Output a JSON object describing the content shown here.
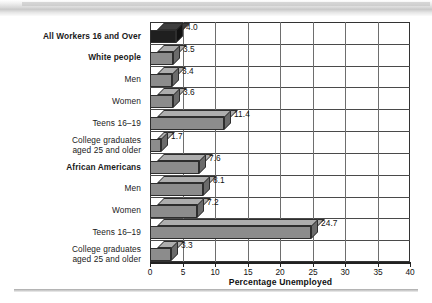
{
  "chart_data": {
    "type": "bar",
    "orientation": "horizontal",
    "title": "",
    "xlabel": "Percentage Unemployed",
    "ylabel": "",
    "xlim": [
      0,
      40
    ],
    "xticks": [
      0,
      5,
      10,
      15,
      20,
      25,
      30,
      35,
      40
    ],
    "grid": true,
    "legend": null,
    "categories": [
      "All Workers 16 and Over",
      "White people",
      "Men",
      "Women",
      "Teens 16–19",
      "College graduates\naged 25 and older",
      "African Americans",
      "Men",
      "Women",
      "Teens 16–19",
      "College graduates\naged 25 and older"
    ],
    "values": [
      4.0,
      3.5,
      3.4,
      3.6,
      11.4,
      1.7,
      7.6,
      8.1,
      7.2,
      24.7,
      3.3
    ],
    "value_labels": [
      "4.0",
      "3.5",
      "3.4",
      "3.6",
      "11.4",
      "1.7",
      "7.6",
      "8.1",
      "7.2",
      "24.7",
      "3.3"
    ],
    "bold_categories": [
      true,
      true,
      false,
      false,
      false,
      false,
      true,
      false,
      false,
      false,
      false
    ],
    "bar_colors": [
      "#1f1f1f",
      "#8c8c8c",
      "#8c8c8c",
      "#8c8c8c",
      "#8c8c8c",
      "#8c8c8c",
      "#8c8c8c",
      "#8c8c8c",
      "#8c8c8c",
      "#8c8c8c",
      "#8c8c8c"
    ]
  },
  "axis": {
    "title": "Percentage Unemployed",
    "tick_labels": [
      "0",
      "5",
      "10",
      "15",
      "20",
      "25",
      "30",
      "35",
      "40"
    ]
  },
  "labels": {
    "c0": "All Workers 16 and Over",
    "c1": "White people",
    "c2": "Men",
    "c3": "Women",
    "c4": "Teens 16–19",
    "c5": "College graduates\naged 25 and older",
    "c6": "African Americans",
    "c7": "Men",
    "c8": "Women",
    "c9": "Teens 16–19",
    "c10": "College graduates\naged 25 and older"
  },
  "values": {
    "v0": "4.0",
    "v1": "3.5",
    "v2": "3.4",
    "v3": "3.6",
    "v4": "11.4",
    "v5": "1.7",
    "v6": "7.6",
    "v7": "8.1",
    "v8": "7.2",
    "v9": "24.7",
    "v10": "3.3"
  },
  "theme": {
    "bar_fill": "#8c8c8c",
    "bar_fill_dark": "#1f1f1f",
    "bar_top": "#adadad",
    "bar_side": "#6b6b6b",
    "frame": "#333333",
    "grid": "#4a4a4a",
    "text": "#111111"
  }
}
